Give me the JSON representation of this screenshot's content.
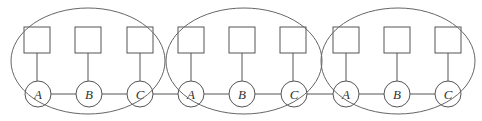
{
  "diagram": {
    "colors": {
      "stroke": "#555555",
      "ellipse": "#666666",
      "text": "#333333",
      "background": "#ffffff"
    },
    "groups": [
      {
        "id": "group-1",
        "ellipse": {
          "cx": 88,
          "cy": 61,
          "rx": 77,
          "ry": 53
        },
        "nodes": [
          {
            "label": "A",
            "cx": 38,
            "cy": 94,
            "box_x": 24
          },
          {
            "label": "B",
            "cx": 89,
            "cy": 94,
            "box_x": 75
          },
          {
            "label": "C",
            "cx": 140,
            "cy": 94,
            "box_x": 127
          }
        ]
      },
      {
        "id": "group-2",
        "ellipse": {
          "cx": 244,
          "cy": 61,
          "rx": 78,
          "ry": 53
        },
        "nodes": [
          {
            "label": "A",
            "cx": 191,
            "cy": 94,
            "box_x": 178
          },
          {
            "label": "B",
            "cx": 242,
            "cy": 94,
            "box_x": 229
          },
          {
            "label": "C",
            "cx": 294,
            "cy": 94,
            "box_x": 280
          }
        ]
      },
      {
        "id": "group-3",
        "ellipse": {
          "cx": 398,
          "cy": 61,
          "rx": 77,
          "ry": 53
        },
        "nodes": [
          {
            "label": "A",
            "cx": 346,
            "cy": 94,
            "box_x": 333
          },
          {
            "label": "B",
            "cx": 397,
            "cy": 94,
            "box_x": 384
          },
          {
            "label": "C",
            "cx": 448,
            "cy": 94,
            "box_x": 435
          }
        ]
      }
    ],
    "box": {
      "y": 27,
      "w": 26,
      "h": 26
    },
    "node_radius": 13,
    "chain_y": 94
  }
}
